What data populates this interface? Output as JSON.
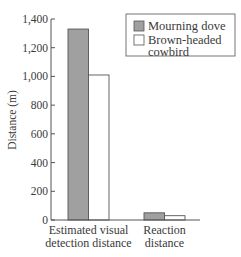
{
  "chart_data": {
    "type": "bar",
    "title": "",
    "xlabel": "",
    "ylabel": "Distance (m)",
    "ylim": [
      0,
      1400
    ],
    "yticks": [
      "0",
      "200",
      "400",
      "600",
      "800",
      "1,000",
      "1,200",
      "1,400"
    ],
    "categories": [
      "Estimated visual detection distance",
      "Reaction distance"
    ],
    "category_lines": [
      [
        "Estimated visual",
        "detection distance"
      ],
      [
        "Reaction",
        "distance"
      ]
    ],
    "series": [
      {
        "name": "Mourning dove",
        "color": "#a0a0a0",
        "values": [
          1330,
          50
        ]
      },
      {
        "name": "Brown-headed cowbird",
        "color": "#ffffff",
        "values": [
          1010,
          30
        ]
      }
    ],
    "legend": {
      "position": "upper right",
      "entries": [
        [
          "Mourning dove"
        ],
        [
          "Brown-headed",
          "cowbird"
        ]
      ]
    },
    "grid": false
  }
}
